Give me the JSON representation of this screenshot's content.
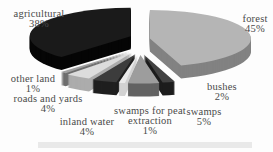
{
  "chart_data": {
    "type": "pie",
    "style": "3d-exploded",
    "title": "",
    "unit": "%",
    "direction": "clockwise",
    "start_angle_deg": 0,
    "legend_position": "labels-around-chart",
    "background_color": "#fdfdfd",
    "label_color": "#4a4a4a",
    "slices": [
      {
        "label": "forest",
        "value": 45,
        "pct": "45%",
        "color_top": "#b5b5b5",
        "color_side": "#828282"
      },
      {
        "label": "bushes",
        "value": 2,
        "pct": "2%",
        "color_top": "#424242",
        "color_side": "#1d1d1d"
      },
      {
        "label": "swamps",
        "value": 5,
        "pct": "5%",
        "color_top": "#9d9d9d",
        "color_side": "#636363"
      },
      {
        "label": "swamps for peat extraction",
        "value": 1,
        "pct": "1%",
        "color_top": "#eaeaea",
        "color_side": "#d2d2d2"
      },
      {
        "label": "inland water",
        "value": 4,
        "pct": "4%",
        "color_top": "#3c3c3c",
        "color_side": "#1f1f1f"
      },
      {
        "label": "roads and yards",
        "value": 4,
        "pct": "4%",
        "color_top": "#dcdcdc",
        "color_side": "#acacac"
      },
      {
        "label": "other land",
        "value": 1,
        "pct": "1%",
        "color_top": "#a0a0a0",
        "color_side": "#6e6e6e"
      },
      {
        "label": "agricultural",
        "value": 38,
        "pct": "38%",
        "color_top": "#1a1a1a",
        "color_side": "#060606"
      }
    ]
  }
}
